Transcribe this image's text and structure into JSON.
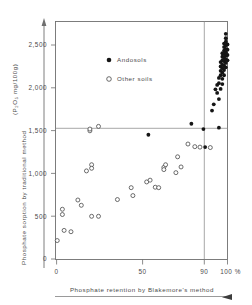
{
  "figure": {
    "background": "#ffffff",
    "frame_color": "#6f6f6f",
    "ink_color": "#151515"
  },
  "axes": {
    "y_title": "Phosphate sorption by traditional method",
    "y_unit": "(P₂O₅ mg/100g)",
    "y_title_full": "Phosphate sorption by traditional method (P₂O₅ mg/100g)",
    "x_title": "Phosphate retention by Blakemore's method",
    "y_ticks": [
      "0",
      "500",
      "1,000",
      "1,500",
      "2,000",
      "2,500"
    ],
    "x_ticks": [
      "0",
      "50",
      "90",
      "100 %"
    ]
  },
  "legend": {
    "position": "upper-left-inside",
    "entries": [
      {
        "label": "Andosols",
        "marker": "filled-circle",
        "color": "#151515"
      },
      {
        "label": "Other soils",
        "marker": "open-circle",
        "color": "#ffffff"
      }
    ]
  },
  "chart_data": {
    "type": "scatter",
    "title": "",
    "xlabel": "Phosphate retention by Blakemore's method",
    "ylabel": "Phosphate sorption by traditional method (P₂O₅ mg/100g)",
    "xlim": [
      0,
      100
    ],
    "ylim": [
      0,
      2700
    ],
    "xticks": [
      0,
      50,
      90,
      100
    ],
    "xticklabels": [
      "0",
      "50",
      "90",
      "100 %"
    ],
    "yticks": [
      0,
      500,
      1000,
      1500,
      2000,
      2500
    ],
    "yticklabels": [
      "0",
      "500",
      "1,000",
      "1,500",
      "2,000",
      "2,500"
    ],
    "grid": false,
    "reference_lines": [
      {
        "orientation": "horizontal",
        "value": 1500,
        "axis": "y"
      },
      {
        "orientation": "vertical",
        "value": 90,
        "axis": "x"
      }
    ],
    "series": [
      {
        "name": "Other soils",
        "marker": "open-circle",
        "points": [
          [
            1,
            215
          ],
          [
            4,
            510
          ],
          [
            4,
            570
          ],
          [
            5,
            330
          ],
          [
            9,
            315
          ],
          [
            13,
            675
          ],
          [
            15,
            615
          ],
          [
            18,
            1005
          ],
          [
            20,
            1460
          ],
          [
            20,
            1480
          ],
          [
            21,
            1075
          ],
          [
            21,
            1035
          ],
          [
            21,
            490
          ],
          [
            25,
            1510
          ],
          [
            25,
            490
          ],
          [
            36,
            680
          ],
          [
            44,
            815
          ],
          [
            45,
            725
          ],
          [
            53,
            880
          ],
          [
            55,
            900
          ],
          [
            58,
            820
          ],
          [
            60,
            815
          ],
          [
            63,
            1045
          ],
          [
            63,
            1020
          ],
          [
            64,
            1075
          ],
          [
            70,
            985
          ],
          [
            71,
            1165
          ],
          [
            73,
            1050
          ],
          [
            77,
            1310
          ],
          [
            81,
            1280
          ],
          [
            84,
            1275
          ],
          [
            90,
            1270
          ]
        ]
      },
      {
        "name": "Andosols",
        "marker": "filled-circle",
        "points": [
          [
            54,
            1415
          ],
          [
            79,
            1540
          ],
          [
            86,
            1480
          ],
          [
            87,
            1275
          ],
          [
            91,
            1690
          ],
          [
            92,
            1760
          ],
          [
            93,
            1930
          ],
          [
            94,
            1890
          ],
          [
            94,
            1980
          ],
          [
            95,
            1820
          ],
          [
            95,
            2000
          ],
          [
            95,
            2060
          ],
          [
            95,
            1495
          ],
          [
            96,
            1935
          ],
          [
            96,
            2090
          ],
          [
            96,
            2140
          ],
          [
            96,
            2190
          ],
          [
            96,
            2240
          ],
          [
            97,
            1990
          ],
          [
            97,
            2050
          ],
          [
            97,
            2120
          ],
          [
            97,
            2170
          ],
          [
            97,
            2210
          ],
          [
            97,
            2260
          ],
          [
            97,
            2300
          ],
          [
            97,
            2340
          ],
          [
            98,
            2090
          ],
          [
            98,
            2150
          ],
          [
            98,
            2200
          ],
          [
            98,
            2250
          ],
          [
            98,
            2290
          ],
          [
            98,
            2330
          ],
          [
            98,
            2370
          ],
          [
            98,
            2410
          ],
          [
            98,
            2450
          ],
          [
            99,
            2180
          ],
          [
            99,
            2230
          ],
          [
            99,
            2270
          ],
          [
            99,
            2310
          ],
          [
            99,
            2350
          ],
          [
            99,
            2390
          ],
          [
            99,
            2430
          ],
          [
            99,
            2470
          ],
          [
            99,
            2510
          ],
          [
            99,
            2560
          ],
          [
            100,
            2260
          ],
          [
            100,
            2320
          ],
          [
            100,
            2380
          ],
          [
            100,
            2440
          ]
        ]
      }
    ]
  }
}
